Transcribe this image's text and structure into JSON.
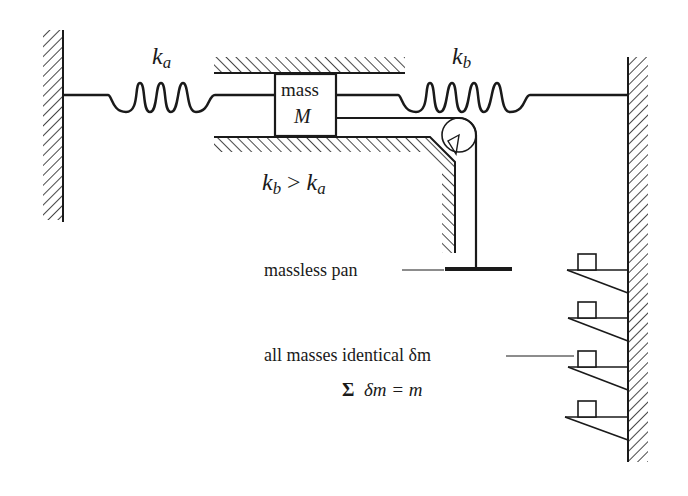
{
  "diagram": {
    "labels": {
      "spring_a": {
        "symbol": "k",
        "subscript": "a"
      },
      "spring_b": {
        "symbol": "k",
        "subscript": "b"
      },
      "mass_line1": "mass",
      "mass_line2": "M",
      "inequality": {
        "lhs_symbol": "k",
        "lhs_sub": "b",
        "op": ">",
        "rhs_symbol": "k",
        "rhs_sub": "a"
      },
      "pan": "massless pan",
      "masses_note": "all masses identical δm",
      "sum_note": {
        "sigma": "Σ",
        "expr": "δm = m"
      }
    },
    "components": {
      "left_wall": "hatched fixed wall",
      "right_wall": "hatched fixed wall",
      "spring_a_coils": 3,
      "spring_b_coils": 4,
      "guide_rails": "hatched top and bottom guides",
      "pulley": "frictionless pulley on bracket",
      "shelves_count": 4
    },
    "colors": {
      "ink": "#1a1a1a",
      "background": "#ffffff"
    }
  }
}
